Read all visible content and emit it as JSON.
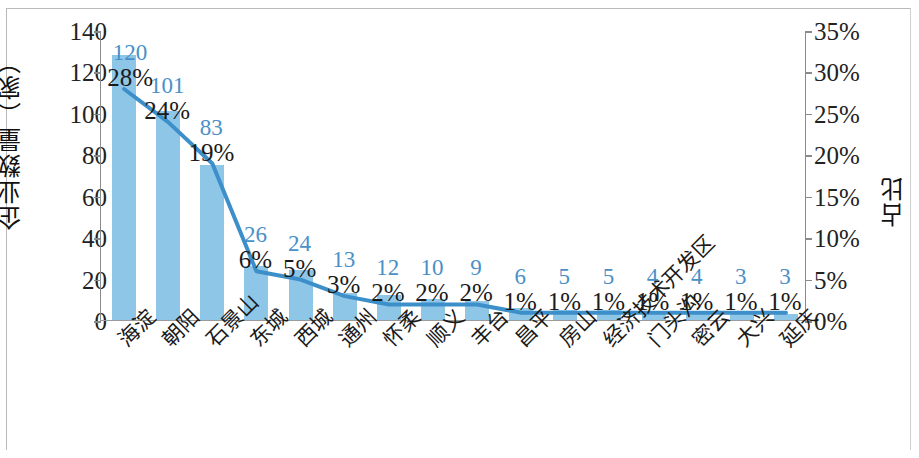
{
  "chart_data": {
    "type": "bar",
    "title": "",
    "xlabel": "",
    "ylabel": "企业数量（家）",
    "y2label": "占比",
    "ylim": [
      0,
      140
    ],
    "y2lim": [
      0,
      35
    ],
    "grid": false,
    "legend": null,
    "categories": [
      "海淀",
      "朝阳",
      "石景山",
      "东城",
      "西城",
      "通州",
      "怀柔",
      "顺义",
      "丰台",
      "昌平",
      "房山",
      "经济技术开发区",
      "门头沟",
      "密云",
      "大兴",
      "延庆"
    ],
    "yticks": [
      "0",
      "20",
      "40",
      "60",
      "80",
      "100",
      "120",
      "140"
    ],
    "ytick_values": [
      0,
      20,
      40,
      60,
      80,
      100,
      120,
      140
    ],
    "y2ticks": [
      "0%",
      "5%",
      "10%",
      "15%",
      "20%",
      "25%",
      "30%",
      "35%"
    ],
    "y2tick_values": [
      0,
      5,
      10,
      15,
      20,
      25,
      30,
      35
    ],
    "series": [
      {
        "name": "企业数量（家）",
        "type": "bar",
        "axis": "left",
        "color": "#8ec6e8",
        "values": [
          128,
          101,
          75,
          26,
          24,
          13,
          12,
          10,
          9,
          6,
          5,
          5,
          4,
          4,
          3,
          3
        ]
      },
      {
        "name": "占比",
        "type": "line",
        "axis": "right",
        "color": "#3d8fc9",
        "values": [
          28,
          24,
          19,
          6,
          5,
          3,
          2,
          2,
          2,
          1,
          1,
          1,
          1,
          1,
          1,
          1
        ]
      }
    ],
    "count_labels": [
      "120",
      "101",
      "83",
      "26",
      "24",
      "13",
      "12",
      "10",
      "9",
      "6",
      "5",
      "5",
      "4",
      "4",
      "3",
      "3"
    ],
    "percent_labels": [
      "28%",
      "24%",
      "19%",
      "6%",
      "5%",
      "3%",
      "2%",
      "2%",
      "2%",
      "1%",
      "1%",
      "1%",
      "1%",
      "1%",
      "1%",
      "1%"
    ],
    "count_label_color": "#4a90c8",
    "percent_label_color": "#1a1a1a"
  }
}
